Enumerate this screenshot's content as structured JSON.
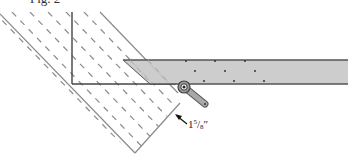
{
  "figure": {
    "caption_partial": "Fig. 2",
    "dimension": {
      "whole": "1",
      "numerator": "5",
      "denominator": "8",
      "unit": "″",
      "text": "1 5/8\""
    },
    "colors": {
      "outline": "#555555",
      "board_edge": "#8a8a8a",
      "grain_dash": "#8a8a8a",
      "fence_fill": "#c8c8c8",
      "fence_edge": "#555555",
      "pivot_fill": "#9a9a9a",
      "pivot_dark": "#333333",
      "background": "#ffffff"
    }
  }
}
